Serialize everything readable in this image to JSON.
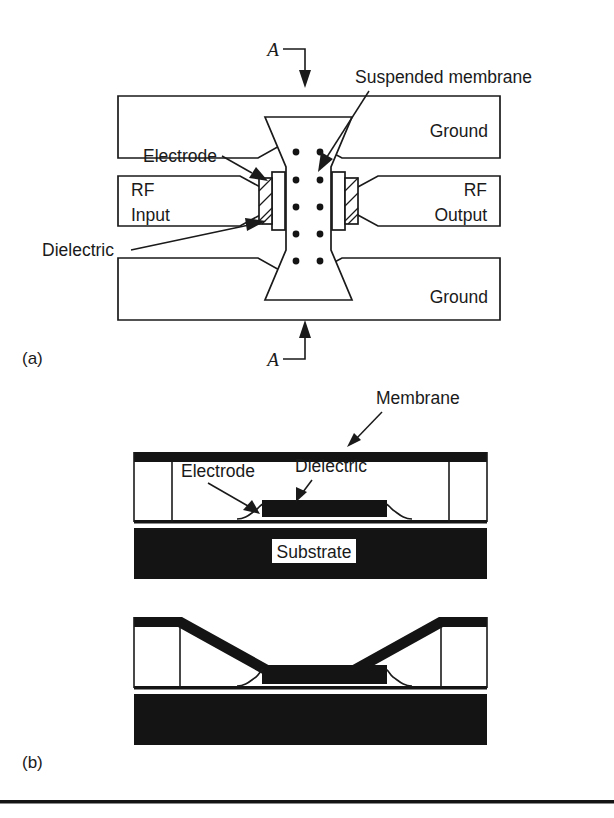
{
  "figure": {
    "type": "technical-diagram",
    "panels": [
      {
        "id": "a",
        "label": "(a)",
        "view": "top view",
        "section_marker": "A"
      },
      {
        "id": "b",
        "label": "(b)",
        "view": "cross section A-A"
      }
    ]
  },
  "panel_a": {
    "caption": "(a)",
    "section_marker_top": "A",
    "section_marker_bottom": "A",
    "labels": {
      "suspended_membrane": "Suspended membrane",
      "electrode": "Electrode",
      "dielectric": "Dielectric",
      "ground_top": "Ground",
      "ground_bottom": "Ground",
      "rf_input_line1": "RF",
      "rf_input_line2": "Input",
      "rf_output_line1": "RF",
      "rf_output_line2": "Output"
    },
    "membrane_holes": {
      "columns": 2,
      "rows": 5,
      "total": 10
    }
  },
  "panel_b": {
    "caption": "(b)",
    "labels": {
      "membrane": "Membrane",
      "electrode": "Electrode",
      "dielectric": "Dielectric",
      "substrate": "Substrate"
    },
    "states": [
      {
        "name": "up-state",
        "description": "membrane suspended above dielectric"
      },
      {
        "name": "down-state",
        "description": "membrane collapsed onto dielectric"
      }
    ]
  },
  "colors": {
    "ink": "#1a1a1a",
    "fill_black": "#141414",
    "background": "#ffffff"
  }
}
